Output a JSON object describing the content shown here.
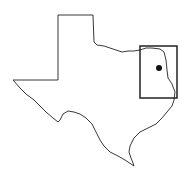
{
  "map": {
    "region": "Texas",
    "outline_color": "#222222",
    "background": "#ffffff",
    "study_area": {
      "x": 140,
      "y": 46,
      "width": 37,
      "height": 52
    },
    "location_marker": {
      "cx": 159,
      "cy": 68,
      "r": 3
    }
  }
}
